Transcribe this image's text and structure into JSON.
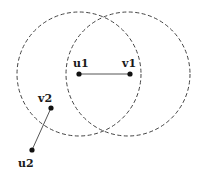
{
  "diagram": {
    "colors": {
      "background": "#ffffff",
      "circle_stroke": "#444444",
      "edge_stroke": "#555555",
      "node_fill": "#111111"
    },
    "circles": [
      {
        "name": "range-circle-u1",
        "cx": 79,
        "cy": 74,
        "r": 62
      },
      {
        "name": "range-circle-v1",
        "cx": 128,
        "cy": 74,
        "r": 62
      }
    ],
    "nodes": [
      {
        "id": "u1",
        "label": "u1",
        "x": 79,
        "y": 74,
        "label_x": 73,
        "label_y": 67
      },
      {
        "id": "v1",
        "label": "v1",
        "x": 130,
        "y": 74,
        "label_x": 122,
        "label_y": 67
      },
      {
        "id": "v2",
        "label": "v2",
        "x": 51,
        "y": 108,
        "label_x": 38,
        "label_y": 102
      },
      {
        "id": "u2",
        "label": "u2",
        "x": 32,
        "y": 150,
        "label_x": 18,
        "label_y": 167
      }
    ],
    "edges": [
      {
        "from": "u1",
        "to": "v1"
      },
      {
        "from": "v2",
        "to": "u2"
      }
    ]
  }
}
